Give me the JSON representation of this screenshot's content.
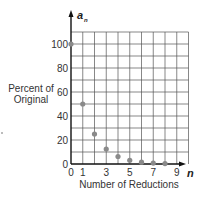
{
  "chart_data": {
    "type": "scatter",
    "title": "",
    "xlabel": "Number of Reductions",
    "ylabel_lines": [
      "Percent of",
      "Original"
    ],
    "x_axis_name": "n",
    "y_axis_name": "a",
    "y_axis_subscript": "n",
    "xlim": [
      0,
      10
    ],
    "ylim": [
      0,
      110
    ],
    "x_ticks": [
      0,
      1,
      3,
      5,
      7,
      9
    ],
    "y_ticks": [
      0,
      20,
      40,
      60,
      80,
      100
    ],
    "grid": true,
    "grid_step_x": 1,
    "grid_step_y": 10,
    "point_color": "#8a8a8a",
    "points": [
      {
        "x": 0,
        "y": 100
      },
      {
        "x": 1,
        "y": 50
      },
      {
        "x": 2,
        "y": 25
      },
      {
        "x": 3,
        "y": 12.5
      },
      {
        "x": 4,
        "y": 6.25
      },
      {
        "x": 5,
        "y": 3.125
      },
      {
        "x": 6,
        "y": 1.5625
      },
      {
        "x": 7,
        "y": 0.78
      },
      {
        "x": 8,
        "y": 0.39
      }
    ]
  }
}
